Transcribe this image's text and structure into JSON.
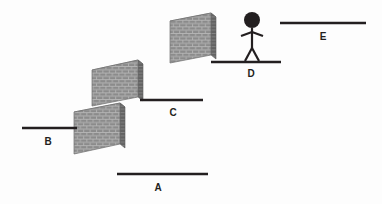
{
  "diagram": {
    "background_color": "#fdfdfd",
    "line_color": "#231f20",
    "label_color": "#231f20",
    "wall_face_color": "#8b8b8b",
    "wall_edge_color": "#5f5f5f",
    "wall_top_color": "#a5a5a5",
    "mortar_color": "#b9b9b9",
    "labels": [
      {
        "id": "A",
        "text": "A",
        "x": 158,
        "y": 191
      },
      {
        "id": "B",
        "text": "B",
        "x": 48,
        "y": 145
      },
      {
        "id": "C",
        "text": "C",
        "x": 173,
        "y": 116
      },
      {
        "id": "D",
        "text": "D",
        "x": 251,
        "y": 77
      },
      {
        "id": "E",
        "text": "E",
        "x": 323,
        "y": 40
      }
    ],
    "lines": [
      {
        "id": "A",
        "x1": 117,
        "y1": 174,
        "x2": 208,
        "y2": 174
      },
      {
        "id": "B",
        "x1": 22,
        "y1": 128,
        "x2": 77,
        "y2": 128
      },
      {
        "id": "C",
        "x1": 140,
        "y1": 100,
        "x2": 203,
        "y2": 100
      },
      {
        "id": "D",
        "x1": 211,
        "y1": 62,
        "x2": 281,
        "y2": 62
      },
      {
        "id": "E",
        "x1": 280,
        "y1": 23,
        "x2": 366,
        "y2": 23
      }
    ],
    "walls": [
      {
        "id": "wall-b",
        "x": 74,
        "y": 103,
        "width": 51,
        "height": 52,
        "rows": 7,
        "cols": 8
      },
      {
        "id": "wall-c",
        "x": 92,
        "y": 60,
        "width": 51,
        "height": 46,
        "rows": 7,
        "cols": 8
      },
      {
        "id": "wall-d",
        "x": 170,
        "y": 13,
        "width": 46,
        "height": 50,
        "rows": 7,
        "cols": 8
      }
    ],
    "figure": {
      "name": "stick-figure",
      "head_cx": 252,
      "head_cy": 20,
      "head_r": 8,
      "body_top": 28,
      "body_bottom": 48,
      "arm_y": 33,
      "arm_half_width": 11,
      "leg_spread": 8,
      "leg_bottom": 62
    }
  }
}
